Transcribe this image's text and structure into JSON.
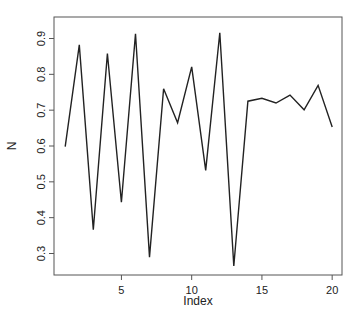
{
  "chart_data": {
    "type": "line",
    "title": "",
    "xlabel": "Index",
    "ylabel": "N",
    "x": [
      1,
      2,
      3,
      4,
      5,
      6,
      7,
      8,
      9,
      10,
      11,
      12,
      13,
      14,
      15,
      16,
      17,
      18,
      19,
      20
    ],
    "series": [
      {
        "name": "N",
        "values": [
          0.598,
          0.882,
          0.366,
          0.858,
          0.443,
          0.913,
          0.29,
          0.76,
          0.665,
          0.821,
          0.532,
          0.916,
          0.265,
          0.725,
          0.733,
          0.72,
          0.742,
          0.701,
          0.769,
          0.653
        ]
      }
    ],
    "xticks": [
      5,
      10,
      15,
      20
    ],
    "yticks": [
      0.3,
      0.4,
      0.5,
      0.6,
      0.7,
      0.8,
      0.9
    ],
    "ytick_labels": [
      "0.3",
      "0.4",
      "0.5",
      "0.6",
      "0.7",
      "0.8",
      "0.9"
    ],
    "xlim": [
      0.2,
      20.7
    ],
    "ylim": [
      0.24,
      0.96
    ],
    "grid": false,
    "legend": null,
    "line_color": "#222222"
  },
  "axes": {
    "xlabel": "Index",
    "ylabel": "N"
  }
}
